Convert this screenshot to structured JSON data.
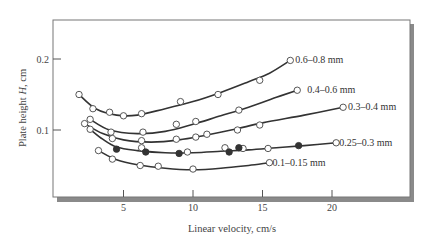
{
  "chart_data": {
    "type": "scatter",
    "title": "",
    "xlabel": "Linear velocity, cm/s",
    "ylabel": "Plate height H, cm",
    "ylabel_parts": {
      "prefix": "Plate height ",
      "italic": "H",
      "suffix": ", cm"
    },
    "xlim": [
      0,
      25.5
    ],
    "ylim": [
      0,
      0.25
    ],
    "xticks": [
      5,
      10,
      15,
      20
    ],
    "xtick_labels": [
      "5",
      "10",
      "15",
      "20"
    ],
    "yticks": [
      0.1,
      0.2
    ],
    "ytick_labels": [
      "0.1",
      "0.2"
    ],
    "grid": false,
    "legend": "inline labels at line ends",
    "series": [
      {
        "name": "0.6–0.8 mm",
        "label": "0.6–0.8 mm",
        "open_points": [
          [
            1.8,
            0.15
          ],
          [
            2.8,
            0.13
          ],
          [
            4.0,
            0.125
          ],
          [
            5.0,
            0.12
          ],
          [
            6.3,
            0.123
          ],
          [
            9.1,
            0.14
          ],
          [
            11.8,
            0.15
          ],
          [
            14.8,
            0.17
          ],
          [
            17.0,
            0.198
          ]
        ],
        "filled_points": [],
        "curve": [
          [
            1.8,
            0.15
          ],
          [
            3.0,
            0.13
          ],
          [
            4.5,
            0.121
          ],
          [
            6.0,
            0.121
          ],
          [
            8.0,
            0.13
          ],
          [
            10.0,
            0.14
          ],
          [
            12.0,
            0.153
          ],
          [
            14.0,
            0.168
          ],
          [
            15.5,
            0.18
          ],
          [
            17.0,
            0.198
          ]
        ]
      },
      {
        "name": "0.4–0.6 mm",
        "label": "0.4–0.6 mm",
        "open_points": [
          [
            2.6,
            0.115
          ],
          [
            4.1,
            0.097
          ],
          [
            6.4,
            0.097
          ],
          [
            8.8,
            0.108
          ],
          [
            10.2,
            0.112
          ],
          [
            13.3,
            0.128
          ],
          [
            17.5,
            0.156
          ]
        ],
        "filled_points": [],
        "curve": [
          [
            2.6,
            0.115
          ],
          [
            4.0,
            0.1
          ],
          [
            6.0,
            0.095
          ],
          [
            8.0,
            0.098
          ],
          [
            10.0,
            0.108
          ],
          [
            12.0,
            0.12
          ],
          [
            14.0,
            0.132
          ],
          [
            16.0,
            0.146
          ],
          [
            17.5,
            0.156
          ]
        ]
      },
      {
        "name": "0.3–0.4 mm",
        "label": "0.3–0.4 mm",
        "open_points": [
          [
            2.2,
            0.109
          ],
          [
            4.2,
            0.088
          ],
          [
            6.3,
            0.085
          ],
          [
            8.8,
            0.087
          ],
          [
            10.2,
            0.09
          ],
          [
            11.0,
            0.094
          ],
          [
            13.2,
            0.1
          ],
          [
            14.8,
            0.107
          ],
          [
            20.8,
            0.132
          ]
        ],
        "filled_points": [],
        "curve": [
          [
            2.2,
            0.109
          ],
          [
            3.5,
            0.095
          ],
          [
            5.0,
            0.086
          ],
          [
            7.0,
            0.083
          ],
          [
            9.0,
            0.086
          ],
          [
            11.0,
            0.093
          ],
          [
            13.0,
            0.101
          ],
          [
            15.0,
            0.11
          ],
          [
            18.0,
            0.121
          ],
          [
            20.8,
            0.132
          ]
        ]
      },
      {
        "name": "0.25–0.3 mm",
        "label": "0.25–0.3 mm",
        "open_points": [
          [
            2.6,
            0.101
          ],
          [
            6.3,
            0.075
          ],
          [
            9.6,
            0.069
          ],
          [
            12.3,
            0.075
          ],
          [
            13.6,
            0.074
          ],
          [
            15.4,
            0.074
          ],
          [
            20.3,
            0.082
          ]
        ],
        "filled_points": [
          [
            4.5,
            0.073
          ],
          [
            6.6,
            0.069
          ],
          [
            9.0,
            0.067
          ],
          [
            12.6,
            0.069
          ],
          [
            13.3,
            0.075
          ],
          [
            17.6,
            0.078
          ]
        ],
        "curve": [
          [
            2.6,
            0.101
          ],
          [
            3.5,
            0.087
          ],
          [
            4.5,
            0.076
          ],
          [
            6.0,
            0.071
          ],
          [
            8.0,
            0.068
          ],
          [
            10.0,
            0.068
          ],
          [
            12.0,
            0.07
          ],
          [
            14.0,
            0.072
          ],
          [
            16.0,
            0.075
          ],
          [
            18.0,
            0.078
          ],
          [
            20.3,
            0.082
          ]
        ]
      },
      {
        "name": "0.1–0.15 mm",
        "label": "0.1–0.15 mm",
        "open_points": [
          [
            3.2,
            0.071
          ],
          [
            4.2,
            0.059
          ],
          [
            6.2,
            0.05
          ],
          [
            7.5,
            0.049
          ],
          [
            10.0,
            0.045
          ],
          [
            15.5,
            0.054
          ]
        ],
        "filled_points": [],
        "curve": [
          [
            3.2,
            0.071
          ],
          [
            4.5,
            0.058
          ],
          [
            6.0,
            0.051
          ],
          [
            8.0,
            0.046
          ],
          [
            10.0,
            0.044
          ],
          [
            12.0,
            0.046
          ],
          [
            14.0,
            0.05
          ],
          [
            15.5,
            0.054
          ]
        ]
      }
    ]
  }
}
